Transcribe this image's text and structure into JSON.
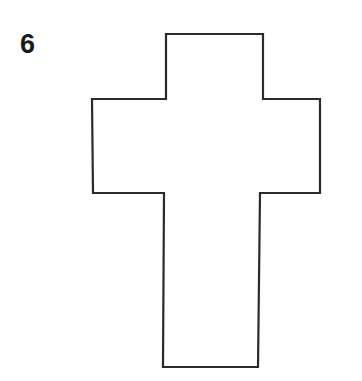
{
  "page": {
    "background_color": "#ffffff",
    "width": 362,
    "height": 381
  },
  "figure": {
    "label": "6",
    "label_color": "#1a1a1a",
    "shape_name": "latin-cross",
    "stroke_color": "#2b2b2b",
    "fill_color": "#ffffff",
    "stroke_width": 2.2,
    "outline_points": "166,34 263,34 263,99 320,99 320,193 260,193 258,367 163,367 164,193 93,193 92,99 166,99"
  }
}
